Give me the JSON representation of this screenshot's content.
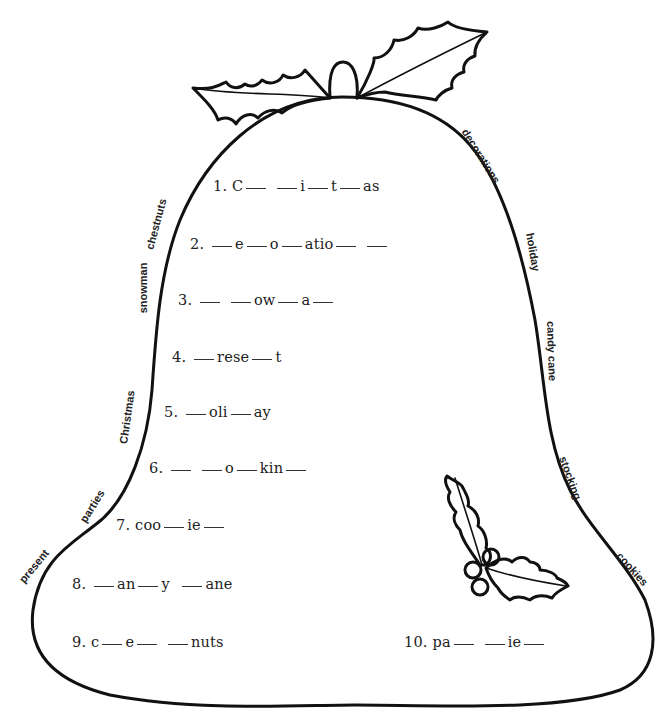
{
  "worksheet": {
    "type": "Christmas missing-letters bell worksheet",
    "puzzles": [
      {
        "number": "1.",
        "pattern": [
          "C",
          "_",
          " ",
          "_",
          "i",
          "_",
          "t",
          "_",
          "as"
        ]
      },
      {
        "number": "2.",
        "pattern": [
          "_",
          "e",
          "_",
          "o",
          "_",
          "atio",
          "_",
          " ",
          "_"
        ]
      },
      {
        "number": "3.",
        "pattern": [
          "_",
          " ",
          "_",
          "ow",
          "_",
          "a",
          "_"
        ]
      },
      {
        "number": "4.",
        "pattern": [
          "_",
          "rese",
          "_",
          "t"
        ]
      },
      {
        "number": "5.",
        "pattern": [
          "_",
          "oli",
          "_",
          "ay"
        ]
      },
      {
        "number": "6.",
        "pattern": [
          "_",
          " ",
          "_",
          "o",
          "_",
          "kin",
          "_"
        ]
      },
      {
        "number": "7.",
        "pattern": [
          "coo",
          "_",
          "ie",
          "_"
        ]
      },
      {
        "number": "8.",
        "pattern": [
          "_",
          "an",
          "_",
          "y",
          " ",
          "_",
          "ane"
        ]
      },
      {
        "number": "9.",
        "pattern": [
          "c",
          "_",
          "e",
          "_",
          " ",
          "_",
          "nuts"
        ]
      },
      {
        "number": "10.",
        "pattern": [
          "pa",
          "_",
          " ",
          "_",
          "ie",
          "_"
        ]
      }
    ],
    "word_bank_left": [
      "chestnuts",
      "snowman",
      "Christmas",
      "parties",
      "present"
    ],
    "word_bank_right": [
      "decorations",
      "holiday",
      "candy cane",
      "stocking",
      "cookies"
    ],
    "decorations": [
      "holly-leaves-top",
      "bell-top-knob",
      "holly-sprig-with-berries"
    ]
  }
}
